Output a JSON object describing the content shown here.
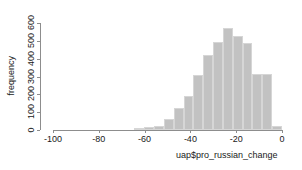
{
  "chart_data": {
    "type": "bar",
    "title": "",
    "xlabel": "uap$pro_russian_change",
    "ylabel": "frequency",
    "xlim": [
      -100,
      0
    ],
    "ylim": [
      0,
      600
    ],
    "grid": false,
    "legend": null,
    "bin_width": 4.3,
    "xticks": [
      -100,
      -80,
      -60,
      -40,
      -20,
      0
    ],
    "xticklabels": [
      "-100",
      "-80",
      "-60",
      "-40",
      "-20",
      "0"
    ],
    "yticks": [
      0,
      100,
      200,
      300,
      400,
      500,
      600
    ],
    "yticklabels": [
      "0",
      "100",
      "200",
      "300",
      "400",
      "500",
      "600"
    ],
    "bar_color": "#c2c2c2",
    "bar_edge_color": "#d6d6d6",
    "axis_color": "#8d8d8d",
    "bins": [
      {
        "x0": -64.5,
        "x1": -60.2,
        "value": 8
      },
      {
        "x0": -60.2,
        "x1": -55.9,
        "value": 18
      },
      {
        "x0": -55.9,
        "x1": -51.6,
        "value": 22
      },
      {
        "x0": -51.6,
        "x1": -47.3,
        "value": 60
      },
      {
        "x0": -47.3,
        "x1": -43.0,
        "value": 125
      },
      {
        "x0": -43.0,
        "x1": -38.7,
        "value": 190
      },
      {
        "x0": -38.7,
        "x1": -34.4,
        "value": 310
      },
      {
        "x0": -34.4,
        "x1": -30.1,
        "value": 418
      },
      {
        "x0": -30.1,
        "x1": -25.8,
        "value": 495
      },
      {
        "x0": -25.8,
        "x1": -21.5,
        "value": 570
      },
      {
        "x0": -21.5,
        "x1": -17.2,
        "value": 525
      },
      {
        "x0": -17.2,
        "x1": -12.9,
        "value": 487
      },
      {
        "x0": -12.9,
        "x1": -8.6,
        "value": 315
      },
      {
        "x0": -8.6,
        "x1": -4.3,
        "value": 315
      },
      {
        "x0": -4.3,
        "x1": 0.0,
        "value": 22
      }
    ]
  }
}
